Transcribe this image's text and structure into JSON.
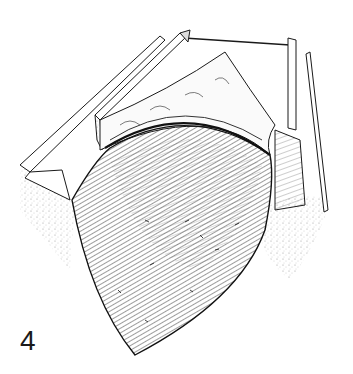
{
  "figure": {
    "label": "4",
    "style": "pen-and-ink line drawing",
    "ink_color": "#1a1a1a",
    "background": "#ffffff"
  }
}
